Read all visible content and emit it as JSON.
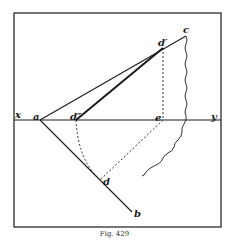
{
  "figure": {
    "caption": "Fig. 429",
    "ink_color": "#1a1a1a",
    "background": "#ffffff"
  },
  "labels": {
    "x": "x",
    "y": "y",
    "a": "a",
    "d_double_prime": "d″",
    "e": "e",
    "d_prime": "d′",
    "c": "c",
    "d": "d",
    "b": "b"
  },
  "points": {
    "a": [
      40,
      120
    ],
    "d_double_prime": [
      76,
      120
    ],
    "e": [
      163,
      120
    ],
    "d_prime": [
      163,
      48
    ],
    "c": [
      186,
      36
    ],
    "d": [
      100,
      180
    ],
    "b": [
      132,
      212
    ]
  }
}
